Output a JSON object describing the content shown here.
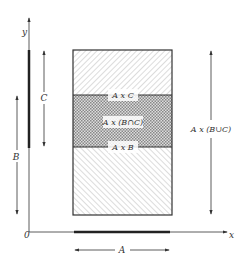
{
  "figure": {
    "axes": {
      "x_label": "x",
      "y_label": "y",
      "origin_label": "0"
    },
    "regions": {
      "top": "A x C",
      "middle": "A x (B∩C)",
      "bottom": "A x B"
    },
    "dimensions": {
      "a_label": "A",
      "b_label": "B",
      "c_label": "C",
      "union_label": "A x (B∪C)"
    },
    "colors": {
      "ink": "#333333",
      "hatch": "#888888",
      "background": "#ffffff"
    }
  }
}
